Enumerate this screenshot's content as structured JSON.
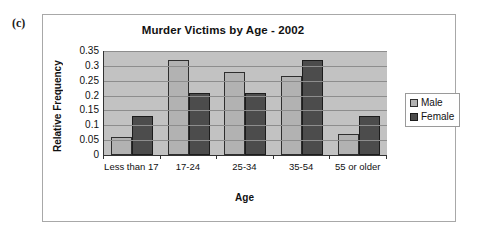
{
  "figure_label": "(c)",
  "chart_data": {
    "type": "bar",
    "title": "Murder Victims by Age - 2002",
    "xlabel": "Age",
    "ylabel": "Relative Frequency",
    "categories": [
      "Less than 17",
      "17-24",
      "25-34",
      "35-54",
      "55 or older"
    ],
    "series": [
      {
        "name": "Male",
        "color": "#b2b2b2",
        "values": [
          0.06,
          0.32,
          0.28,
          0.265,
          0.07
        ]
      },
      {
        "name": "Female",
        "color": "#4c4c4c",
        "values": [
          0.13,
          0.21,
          0.21,
          0.32,
          0.13
        ]
      }
    ],
    "ylim": [
      0,
      0.35
    ],
    "yticks": [
      "0",
      "0.05",
      "0.1",
      "0.15",
      "0.2",
      "0.25",
      "0.3",
      "0.35"
    ],
    "ytick_values": [
      0,
      0.05,
      0.1,
      0.15,
      0.2,
      0.25,
      0.3,
      0.35
    ],
    "grid": true,
    "legend_position": "right",
    "plot_background": "#c2c2c2"
  }
}
